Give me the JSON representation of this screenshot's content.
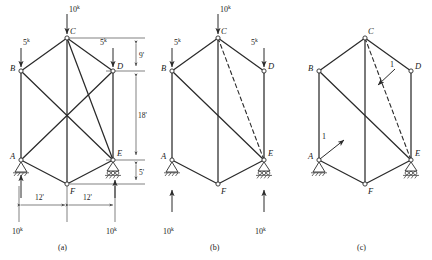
{
  "figure": {
    "captions": {
      "a": "(a)",
      "b": "(b)",
      "c": "(c)"
    },
    "joint_labels": {
      "A": "A",
      "B": "B",
      "C": "C",
      "D": "D",
      "E": "E",
      "F": "F"
    },
    "force_unit": "k",
    "loads": {
      "top_value": "10",
      "left_value": "5",
      "right_value": "5",
      "reaction_left": "10",
      "reaction_right": "10"
    },
    "dimensions": {
      "top_vertical": "9'",
      "mid_vertical": "18'",
      "bottom_vertical": "5'",
      "left_horizontal": "12'",
      "right_horizontal": "12'"
    },
    "unit_loads": {
      "lower_left": "1",
      "upper_right": "1"
    },
    "supports": {
      "A": "pin-support",
      "E": "roller-support"
    },
    "members_a": [
      "A-B",
      "B-C",
      "C-D",
      "D-E",
      "E-F",
      "F-A",
      "C-F",
      "B-E",
      "C-E"
    ],
    "members_dashed_b": [
      "C-E"
    ],
    "members_dashed_c": [
      "C-E"
    ],
    "colors": {
      "member": "#2b2b2b",
      "dimension": "#4a4a4a",
      "background": "#ffffff"
    }
  }
}
